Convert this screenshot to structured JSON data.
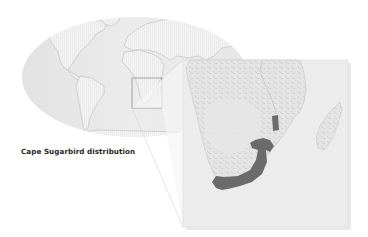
{
  "caption": "Cape Sugarbird distribution",
  "map": {
    "world_map": {
      "projection": "elliptical-world",
      "ocean_color": "#e6e6e6",
      "land_color": "#f4f4f4",
      "land_stroke": "#bdbdbd",
      "locator_box": {
        "x": 132,
        "y": 78,
        "width": 30,
        "height": 30,
        "stroke": "#8f8f8f",
        "region": "southern-africa"
      }
    },
    "inset_map": {
      "region": "Southern Africa",
      "x": 183,
      "y": 60,
      "width": 165,
      "height": 167,
      "background": "#ececec",
      "land_color": "#e3e3e3",
      "relief_color": "#d2d2d2",
      "features": [
        "southern-africa",
        "madagascar"
      ]
    },
    "distribution": {
      "species": "Cape Sugarbird",
      "fill": "#6b6b6b",
      "areas": [
        "eastern-highlands-patch",
        "southern-cape-and-east-coast-band"
      ]
    }
  }
}
